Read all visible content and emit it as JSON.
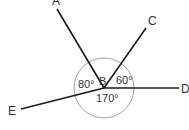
{
  "diagram": {
    "type": "angles-at-point",
    "center_point": "B",
    "points": [
      {
        "name": "A",
        "label": "A"
      },
      {
        "name": "B",
        "label": "B"
      },
      {
        "name": "C",
        "label": "C"
      },
      {
        "name": "D",
        "label": "D"
      },
      {
        "name": "E",
        "label": "E"
      }
    ],
    "angles": [
      {
        "between": "EBA",
        "label": "80°"
      },
      {
        "between": "CBD",
        "label": "60°"
      },
      {
        "between": "EBD",
        "label": "170°"
      }
    ],
    "line_color": "#1a1a1a",
    "arc_color": "#888888"
  }
}
